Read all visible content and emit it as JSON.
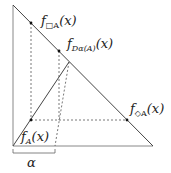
{
  "labels": {
    "box": "f",
    "box_sub": "□A",
    "box_arg": "(x)",
    "d": "f",
    "d_sub": "Dα(A)",
    "d_arg": "(x)",
    "diamond": "f",
    "diamond_sub": "◇A",
    "diamond_arg": "(x)",
    "a": "f",
    "a_sub": "A",
    "a_arg": "(x)",
    "alpha": "α"
  },
  "colors": {
    "line": "#444444",
    "axis": "#888888",
    "text": "#222222"
  }
}
